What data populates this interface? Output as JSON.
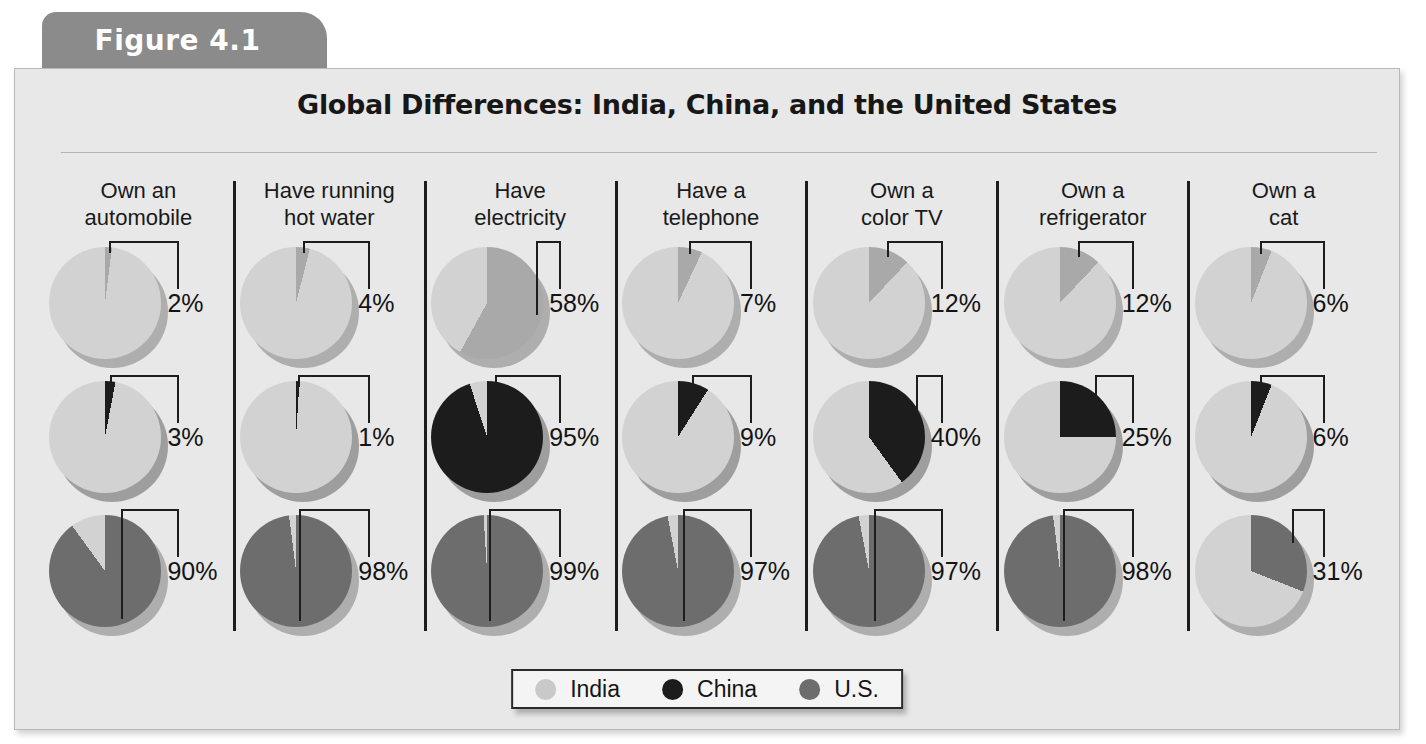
{
  "figure": {
    "tab_label": "Figure 4.1",
    "title": "Global Differences: India, China, and the United States"
  },
  "legend": {
    "items": [
      {
        "label": "India",
        "color": "#c9c9c9"
      },
      {
        "label": "China",
        "color": "#1c1c1c"
      },
      {
        "label": "U.S.",
        "color": "#6d6d6d"
      }
    ]
  },
  "colors": {
    "panel_background": "#e8e8e8",
    "tab_background": "#8b8b8b",
    "india_base": "#d2d2d2",
    "india_slice": "#a9a9a9",
    "china_base": "#d2d2d2",
    "china_slice": "#1c1c1c",
    "us_base": "#d2d2d2",
    "us_slice": "#6d6d6d",
    "divider": "#1d1d1d",
    "text": "#141414"
  },
  "chart_data": {
    "type": "pie",
    "title": "Global Differences: India, China, and the United States",
    "xlabel": "",
    "ylabel": "",
    "units": "percent",
    "categories": [
      "Own an automobile",
      "Have running hot water",
      "Have electricity",
      "Have a telephone",
      "Own a color TV",
      "Own a refrigerator",
      "Own a cat"
    ],
    "series": [
      {
        "name": "India",
        "values": [
          2,
          4,
          58,
          7,
          12,
          12,
          6
        ]
      },
      {
        "name": "China",
        "values": [
          3,
          1,
          95,
          9,
          40,
          25,
          6
        ]
      },
      {
        "name": "U.S.",
        "values": [
          90,
          98,
          99,
          97,
          97,
          98,
          31
        ]
      }
    ],
    "legend_position": "bottom",
    "grid": false
  },
  "columns": [
    {
      "header": "Own an\nautomobile",
      "cells": [
        {
          "country": "India",
          "value": 2,
          "label": "2%"
        },
        {
          "country": "China",
          "value": 3,
          "label": "3%"
        },
        {
          "country": "U.S.",
          "value": 90,
          "label": "90%"
        }
      ]
    },
    {
      "header": "Have running\nhot water",
      "cells": [
        {
          "country": "India",
          "value": 4,
          "label": "4%"
        },
        {
          "country": "China",
          "value": 1,
          "label": "1%"
        },
        {
          "country": "U.S.",
          "value": 98,
          "label": "98%"
        }
      ]
    },
    {
      "header": "Have\nelectricity",
      "cells": [
        {
          "country": "India",
          "value": 58,
          "label": "58%"
        },
        {
          "country": "China",
          "value": 95,
          "label": "95%"
        },
        {
          "country": "U.S.",
          "value": 99,
          "label": "99%"
        }
      ]
    },
    {
      "header": "Have a\ntelephone",
      "cells": [
        {
          "country": "India",
          "value": 7,
          "label": "7%"
        },
        {
          "country": "China",
          "value": 9,
          "label": "9%"
        },
        {
          "country": "U.S.",
          "value": 97,
          "label": "97%"
        }
      ]
    },
    {
      "header": "Own a\ncolor TV",
      "cells": [
        {
          "country": "India",
          "value": 12,
          "label": "12%"
        },
        {
          "country": "China",
          "value": 40,
          "label": "40%"
        },
        {
          "country": "U.S.",
          "value": 97,
          "label": "97%"
        }
      ]
    },
    {
      "header": "Own a\nrefrigerator",
      "cells": [
        {
          "country": "India",
          "value": 12,
          "label": "12%"
        },
        {
          "country": "China",
          "value": 25,
          "label": "25%"
        },
        {
          "country": "U.S.",
          "value": 98,
          "label": "98%"
        }
      ]
    },
    {
      "header": "Own a\ncat",
      "cells": [
        {
          "country": "India",
          "value": 6,
          "label": "6%"
        },
        {
          "country": "China",
          "value": 6,
          "label": "6%"
        },
        {
          "country": "U.S.",
          "value": 31,
          "label": "31%"
        }
      ]
    }
  ]
}
